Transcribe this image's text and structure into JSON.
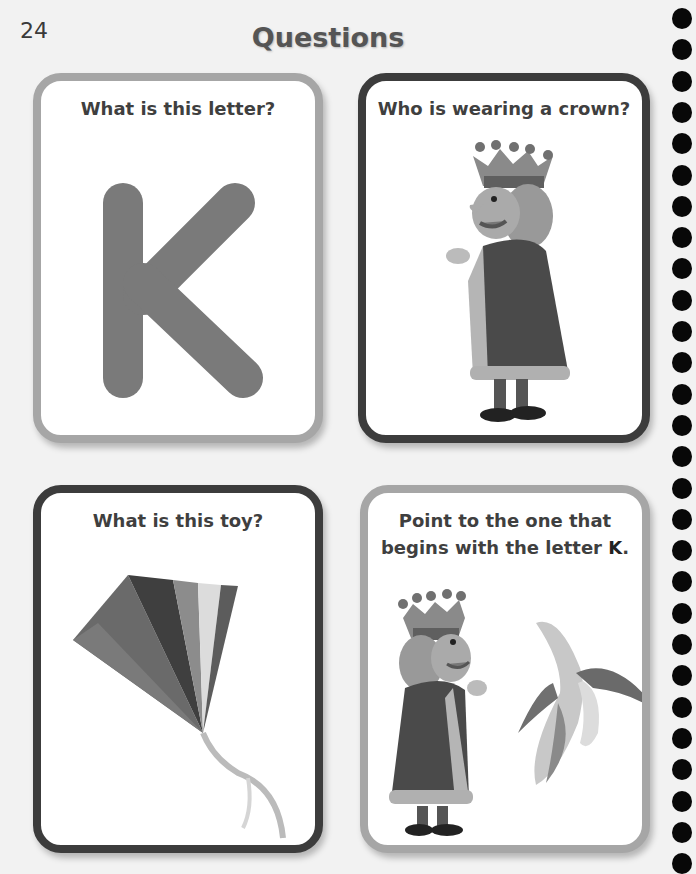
{
  "page": {
    "number": "24",
    "title": "Questions"
  },
  "cards": [
    {
      "question": "What is this letter?",
      "image": "letter-K",
      "letter": "K",
      "border": "#a6a6a6"
    },
    {
      "question": "Who is wearing a crown?",
      "image": "king-illustration",
      "border": "#3c3c3c"
    },
    {
      "question": "What is this toy?",
      "image": "kite-illustration",
      "border": "#3c3c3c"
    },
    {
      "question_line1": "Point to the one that",
      "question_line2": "begins with the letter ",
      "question_emph": "K",
      "question_end": ".",
      "images": [
        "king-illustration",
        "banana-illustration"
      ],
      "border": "#a6a6a6"
    }
  ],
  "binding": {
    "dot_count": 28,
    "dot_color": "#080808"
  }
}
